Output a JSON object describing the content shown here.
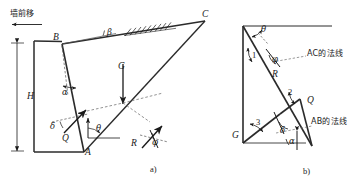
{
  "figure": {
    "caption_top_left": "墙前移",
    "panels": [
      {
        "id": "a",
        "label": "a)"
      },
      {
        "id": "b",
        "label": "b)"
      }
    ]
  },
  "panel_a": {
    "title": "挡土墙主动土压力计算简图",
    "points": {
      "A": "A",
      "B": "B",
      "C": "C"
    },
    "dimensions": {
      "height": "H"
    },
    "angles": {
      "wall_batter": "α",
      "backfill_slope": "β",
      "failure_plane": "θ",
      "wall_friction": "δ",
      "soil_friction": "φ"
    },
    "forces": {
      "weight": "G",
      "wall_reaction": "Q",
      "soil_reaction": "R"
    }
  },
  "panel_b": {
    "title": "力三角形（力多边形）",
    "vertices": {
      "G": "G",
      "Q": "Q"
    },
    "forces": {
      "soil_reaction": "R"
    },
    "angles": {
      "failure_plane": "θ",
      "soil_friction": "φ",
      "wall_friction": "δ",
      "wall_batter": "α"
    },
    "side_numbers": {
      "one": "1",
      "two": "2",
      "three": "3"
    },
    "annotations": {
      "normal_ac": "AC的法线",
      "normal_ab": "AB的法线"
    }
  },
  "colors": {
    "ink": "#1a1a1a",
    "line": "#2b2b2b",
    "dashed": "#6f6f6f"
  }
}
